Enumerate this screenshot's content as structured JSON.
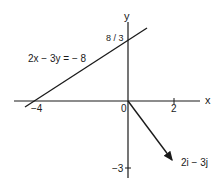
{
  "diagram": {
    "axes": {
      "x_label": "x",
      "y_label": "y",
      "origin_label": "0"
    },
    "ticks": {
      "x_neg4": "−4",
      "x_2": "2",
      "y_8_3": "8 / 3",
      "y_neg3": "−3"
    },
    "line": {
      "equation": "2x − 3y = − 8",
      "x_intercept": -4,
      "y_intercept": "8/3"
    },
    "vector": {
      "label": "2i − 3j",
      "components": [
        2,
        -3
      ]
    },
    "colors": {
      "ink": "#1a1a1a",
      "background": "#ffffff"
    }
  }
}
